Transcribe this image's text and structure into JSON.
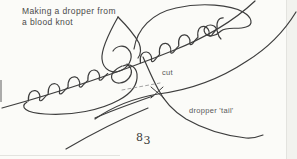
{
  "figure": {
    "caption_line1": "Making a dropper from",
    "caption_line2": "a blood knot",
    "label_cut": "cut",
    "label_tail": "dropper 'tail'",
    "page_number": {
      "first": "8",
      "second": "3"
    }
  },
  "drawing": {
    "description": "loosely tied blood knot: main line with two coiled wraps, two large open loops, centre tangle, dashed cut mark with X, long dropper tail curve",
    "ink_color": "#3e3e3e",
    "dash_color": "#9a9a9a",
    "paper_color": "#fbfbf8"
  }
}
